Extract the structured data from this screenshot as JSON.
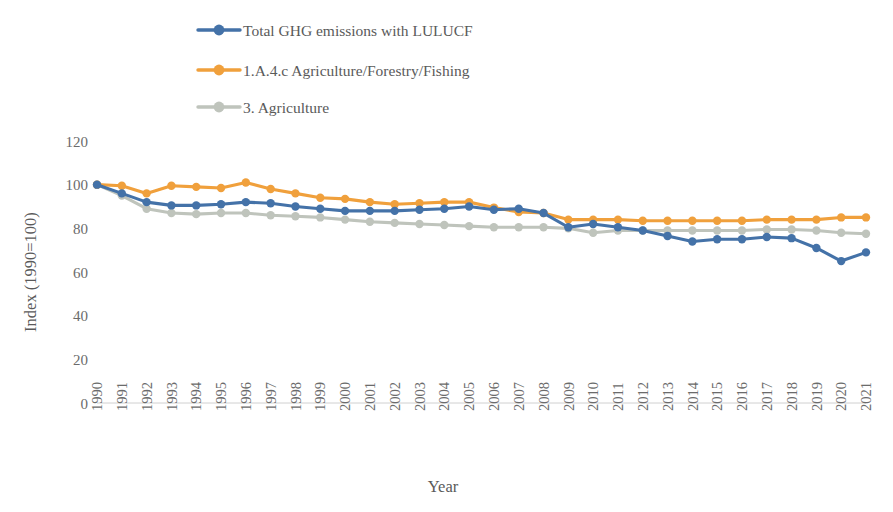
{
  "chart_data": {
    "type": "line",
    "title": "",
    "xlabel": "Year",
    "ylabel": "Index (1990=100)",
    "legend_position": "top",
    "grid": false,
    "ylim": [
      0,
      120
    ],
    "yticks": [
      0,
      20,
      40,
      60,
      80,
      100,
      120
    ],
    "x": [
      1990,
      1991,
      1992,
      1993,
      1994,
      1995,
      1996,
      1997,
      1998,
      1999,
      2000,
      2001,
      2002,
      2003,
      2004,
      2005,
      2006,
      2007,
      2008,
      2009,
      2010,
      2011,
      2012,
      2013,
      2014,
      2015,
      2016,
      2017,
      2018,
      2019,
      2020,
      2021
    ],
    "categories": [
      "1990",
      "1991",
      "1992",
      "1993",
      "1994",
      "1995",
      "1996",
      "1997",
      "1998",
      "1999",
      "2000",
      "2001",
      "2002",
      "2003",
      "2004",
      "2005",
      "2006",
      "2007",
      "2008",
      "2009",
      "2010",
      "2011",
      "2012",
      "2013",
      "2014",
      "2015",
      "2016",
      "2017",
      "2018",
      "2019",
      "2020",
      "2021"
    ],
    "series": [
      {
        "name": "Total GHG emissions with LULUCF",
        "color": "#4472A8",
        "values": [
          100,
          96,
          92,
          90.5,
          90.5,
          91,
          92,
          91.5,
          90,
          89,
          88,
          88,
          88,
          88.5,
          89,
          90,
          88.5,
          89,
          87,
          80.5,
          82,
          80.5,
          79,
          76.5,
          74,
          75,
          75,
          76,
          75.5,
          71,
          65,
          69
        ]
      },
      {
        "name": "1.A.4.c  Agriculture/Forestry/Fishing",
        "color": "#F0A03C",
        "values": [
          100,
          99.5,
          96,
          99.5,
          99,
          98.5,
          101,
          98,
          96,
          94,
          93.5,
          92,
          91,
          91.5,
          92,
          92,
          89.5,
          87.5,
          87,
          84,
          84,
          84,
          83.5,
          83.5,
          83.5,
          83.5,
          83.5,
          84,
          84,
          84,
          85,
          85
        ]
      },
      {
        "name": "3.  Agriculture",
        "color": "#BFC4BC",
        "values": [
          100,
          95,
          89,
          87,
          86.5,
          87,
          87,
          86,
          85.5,
          85,
          84,
          83,
          82.5,
          82,
          81.5,
          81,
          80.5,
          80.5,
          80.5,
          80,
          78,
          79,
          79,
          79,
          79,
          79,
          79,
          79.5,
          79.5,
          79,
          78,
          77.5
        ]
      }
    ]
  },
  "legend": {
    "items": [
      {
        "label": "Total GHG emissions with LULUCF",
        "color": "#4472A8"
      },
      {
        "label": "1.A.4.c  Agriculture/Forestry/Fishing",
        "color": "#F0A03C"
      },
      {
        "label": "3.  Agriculture",
        "color": "#BFC4BC"
      }
    ]
  }
}
